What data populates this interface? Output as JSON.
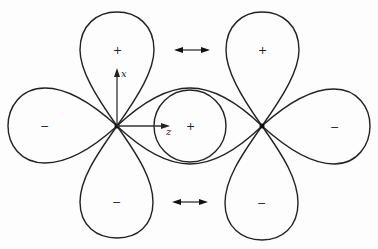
{
  "diagram": {
    "axes": {
      "vertical": "x",
      "horizontal": "z"
    },
    "left_orbital": {
      "lobes": {
        "top": "+",
        "left": "−",
        "bottom": "−"
      }
    },
    "center": {
      "sign": "+"
    },
    "right_orbital": {
      "lobes": {
        "top": "+",
        "right": "−",
        "bottom": "−"
      }
    },
    "arrows": [
      {
        "type": "double-headed",
        "position": "top"
      },
      {
        "type": "double-headed",
        "position": "bottom"
      }
    ]
  }
}
